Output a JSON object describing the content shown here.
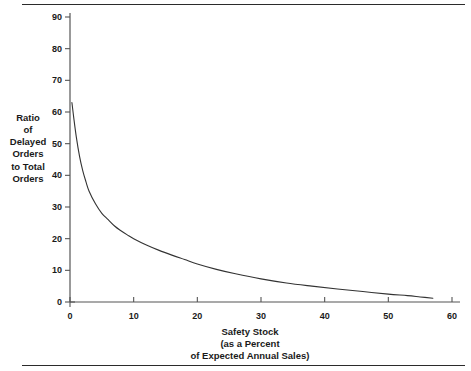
{
  "chart_data": {
    "type": "line",
    "title": "",
    "xlabel": "Safety Stock (as a Percent of Expected Annual Sales)",
    "ylabel": "Ratio of Delayed Orders to Total Orders",
    "xlim": [
      0,
      60
    ],
    "ylim": [
      0,
      93
    ],
    "grid": false,
    "legend": null,
    "x_ticks": [
      0,
      10,
      20,
      30,
      40,
      50,
      60
    ],
    "y_ticks": [
      0,
      10,
      20,
      30,
      40,
      50,
      60,
      70,
      80,
      90
    ],
    "series": [
      {
        "name": "Ratio of Delayed Orders to Total Orders",
        "color": "#333333",
        "x": [
          0.3,
          0.6,
          1.0,
          1.5,
          2.0,
          2.5,
          3.0,
          4.0,
          5.0,
          6.0,
          7.0,
          8.0,
          9.0,
          10.0,
          12.0,
          14.0,
          16.0,
          18.0,
          20.0,
          23.0,
          26.0,
          30.0,
          34.0,
          38.0,
          42.0,
          46.0,
          50.0,
          53.0,
          55.0,
          57.0
        ],
        "y": [
          63.0,
          58.0,
          52.0,
          46.0,
          41.5,
          38.0,
          35.0,
          31.0,
          28.0,
          26.0,
          24.0,
          22.5,
          21.2,
          20.0,
          18.0,
          16.3,
          14.8,
          13.4,
          12.0,
          10.3,
          8.9,
          7.3,
          6.0,
          5.0,
          4.1,
          3.3,
          2.5,
          2.0,
          1.6,
          1.2
        ]
      }
    ]
  },
  "axes": {
    "y_title_lines": [
      "Ratio",
      "of",
      "Delayed",
      "Orders",
      "to Total",
      "Orders"
    ],
    "x_title_lines": [
      "Safety Stock",
      "(as a Percent",
      "of Expected Annual Sales)"
    ],
    "y_tick_labels": [
      "0",
      "10",
      "20",
      "30",
      "40",
      "50",
      "60",
      "70",
      "80",
      "90"
    ],
    "x_tick_labels": [
      "0",
      "10",
      "20",
      "30",
      "40",
      "50",
      "60"
    ]
  },
  "style": {
    "axis_color": "#555555",
    "curve_color": "#333333",
    "rule_color": "#2b2b2b",
    "text_color": "#1a1a1a",
    "background": "#ffffff"
  }
}
